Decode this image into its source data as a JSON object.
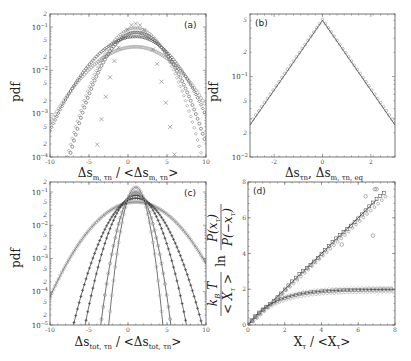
{
  "chart_data": [
    {
      "panel": "(a)",
      "type": "scatter",
      "title": "",
      "xlabel": "Δs_{m,τn} / <Δs_{m,τn}>",
      "ylabel": "pdf",
      "xlim": [
        -10,
        10
      ],
      "ylim": [
        0.0001,
        0.2
      ],
      "yscale": "log",
      "xticks": [
        -10,
        -5,
        0,
        5,
        10
      ],
      "yticks_major": [
        "10^-4",
        "10^-3",
        "10^-2",
        "10^-1"
      ],
      "yticks_minor_labels": [
        "2",
        "5"
      ],
      "grid": false,
      "legend": null,
      "series": [
        {
          "name": "series-1 (widest, light circles)",
          "marker": "circle",
          "color": "#999999",
          "peak_x": 1.0,
          "peak_y": 0.035,
          "left_end": [
            -10,
            0.0006
          ],
          "right_end": [
            10,
            0.0015
          ]
        },
        {
          "name": "series-2 (dark diamonds)",
          "marker": "diamond",
          "color": "#444444",
          "peak_x": 1.0,
          "peak_y": 0.06,
          "left_end": [
            -10,
            0.0004
          ],
          "right_end": [
            10,
            0.0009
          ]
        },
        {
          "name": "series-3 (dark circles)",
          "marker": "circle",
          "color": "#555555",
          "peak_x": 1.0,
          "peak_y": 0.075,
          "left_end": [
            -7.5,
            0.0001
          ],
          "right_end": [
            10,
            0.0002
          ]
        },
        {
          "name": "series-4 (light diamonds)",
          "marker": "diamond",
          "color": "#888888",
          "peak_x": 1.0,
          "peak_y": 0.095,
          "left_end": [
            -7.8,
            0.0001
          ],
          "right_end": [
            9.5,
            0.0001
          ]
        },
        {
          "name": "series-5 (crosses, narrowest)",
          "marker": "x",
          "color": "#777777",
          "peak_x": 1.0,
          "peak_y": 0.12,
          "left_end": [
            -4.2,
            0.0001
          ],
          "right_end": [
            6.0,
            0.0001
          ]
        }
      ],
      "annotation": "(a)"
    },
    {
      "panel": "(b)",
      "type": "scatter",
      "title": "",
      "xlabel": "Δs_{τn},  Δs_{m,τn,eq}",
      "ylabel": "pdf",
      "xlim": [
        -3,
        3
      ],
      "ylim": [
        0.01,
        0.6
      ],
      "yscale": "log",
      "xticks": [
        -2,
        0,
        2
      ],
      "yticks_major": [
        "10^-2",
        "10^-1"
      ],
      "yticks_minor_labels": [
        "2",
        "5",
        "2",
        "5"
      ],
      "grid": false,
      "legend": null,
      "series": [
        {
          "name": "data (circles)",
          "marker": "circle",
          "color": "#999999",
          "x": [
            -3,
            -2,
            -1,
            0,
            1,
            2,
            3
          ],
          "y": [
            0.025,
            0.06,
            0.16,
            0.52,
            0.19,
            0.07,
            0.025
          ]
        },
        {
          "name": "fit (line)",
          "marker": "line",
          "color": "#333333",
          "x": [
            -3,
            0,
            3
          ],
          "y": [
            0.025,
            0.5,
            0.025
          ]
        }
      ],
      "annotation": "(b)"
    },
    {
      "panel": "(c)",
      "type": "scatter",
      "title": "",
      "xlabel": "Δs_{tot,τn} / <Δs_{tot,τn}>",
      "ylabel": "pdf",
      "xlim": [
        -10,
        10
      ],
      "ylim": [
        1e-05,
        0.2
      ],
      "yscale": "log",
      "xticks": [
        -10,
        -5,
        0,
        5,
        10
      ],
      "yticks_major": [
        "10^-5",
        "10^-4",
        "10^-3",
        "10^-2",
        "10^-1"
      ],
      "yticks_minor_labels": [
        "2",
        "5"
      ],
      "grid": false,
      "legend": null,
      "series": [
        {
          "name": "series-1 (widest, light circles)",
          "marker": "circle",
          "color": "#999999",
          "peak_x": 1.0,
          "peak_y": 0.05,
          "left_end": [
            -10,
            7e-05
          ],
          "right_end": [
            10,
            0.0007
          ]
        },
        {
          "name": "series-2 (dark stars)",
          "marker": "star",
          "color": "#444444",
          "peak_x": 1.0,
          "peak_y": 0.065,
          "left_end": [
            -7.0,
            1e-05
          ],
          "right_end": [
            9.5,
            1e-05
          ]
        },
        {
          "name": "series-3 (dark stars)",
          "marker": "star",
          "color": "#444444",
          "peak_x": 1.0,
          "peak_y": 0.08,
          "left_end": [
            -5.5,
            1e-05
          ],
          "right_end": [
            7.5,
            1e-05
          ]
        },
        {
          "name": "series-4 (light)",
          "marker": "circle",
          "color": "#888888",
          "peak_x": 1.0,
          "peak_y": 0.1,
          "left_end": [
            -3.5,
            1e-05
          ],
          "right_end": [
            5.5,
            1e-05
          ]
        },
        {
          "name": "series-5 (narrowest)",
          "marker": "circle",
          "color": "#aaaaaa",
          "peak_x": 1.0,
          "peak_y": 0.14,
          "left_end": [
            -1.5,
            0.001
          ],
          "right_end": [
            3.5,
            0.001
          ]
        }
      ],
      "annotation": "(c)"
    },
    {
      "panel": "(d)",
      "type": "scatter",
      "title": "",
      "xlabel": "X_τ / <X_τ>",
      "ylabel": "k_B T / <X_τ> ln P(x_τ)/P(-x_τ)",
      "xlim": [
        0,
        8
      ],
      "ylim": [
        0,
        8
      ],
      "yscale": "linear",
      "xticks": [
        0,
        2,
        4,
        6,
        8
      ],
      "yticks": [
        0,
        2,
        4,
        6,
        8
      ],
      "grid": false,
      "legend": null,
      "series": [
        {
          "name": "linear branch data (squares/circles/crosses)",
          "marker": "square",
          "color": "#555555",
          "x": [
            0,
            1,
            2,
            3,
            4,
            5,
            6,
            7
          ],
          "y": [
            0,
            1,
            2,
            3,
            4,
            5,
            6,
            7
          ]
        },
        {
          "name": "linear fit",
          "marker": "line",
          "color": "#333333",
          "x": [
            0,
            7
          ],
          "y": [
            0,
            7
          ]
        },
        {
          "name": "saturating branch data",
          "marker": "circle",
          "color": "#888888",
          "x": [
            0,
            1,
            2,
            3,
            4,
            5,
            6,
            7,
            8
          ],
          "y": [
            0,
            0.9,
            1.4,
            1.7,
            1.85,
            1.95,
            2.0,
            2.0,
            2.0
          ]
        },
        {
          "name": "saturating fit",
          "marker": "line",
          "color": "#333333",
          "x": [
            0,
            2,
            4,
            6,
            8
          ],
          "y": [
            0,
            1.35,
            1.8,
            1.95,
            2.0
          ]
        },
        {
          "name": "outliers",
          "marker": "circle",
          "color": "#777777",
          "x": [
            5.1,
            6.8,
            6.4,
            6.9,
            7.0
          ],
          "y": [
            4.5,
            5.0,
            7.2,
            7.6,
            7.6
          ]
        }
      ],
      "annotation": "(d)"
    }
  ],
  "labels": {
    "a": {
      "panel": "(a)",
      "ylabel": "pdf",
      "xlabel_main": "Δs",
      "xlabel_sub": "m, τn",
      "xlabel_sep": " / <Δs",
      "xlabel_sub2": "m, τn",
      "xlabel_end": ">",
      "xticks": [
        "-10",
        "-5",
        "0",
        "5",
        "10"
      ]
    },
    "b": {
      "panel": "(b)",
      "ylabel": "pdf",
      "xlabel_a": "Δs",
      "xlabel_a_sub": "τn",
      "xlabel_comma": ",  Δs",
      "xlabel_b_sub": "m, τn, eq",
      "xticks": [
        "-2",
        "0",
        "2"
      ]
    },
    "c": {
      "panel": "(c)",
      "ylabel": "pdf",
      "xlabel_main": "Δs",
      "xlabel_sub": "tot, τn",
      "xlabel_sep": " / <Δs",
      "xlabel_sub2": "tot, τn",
      "xlabel_end": ">",
      "xticks": [
        "-10",
        "-5",
        "0",
        "5",
        "10"
      ]
    },
    "d": {
      "panel": "(d)",
      "ylabel_frac_num": "k",
      "ylabel_kB_sub": "B",
      "ylabel_T": " T",
      "ylabel_den": "< X",
      "ylabel_den_sub": "τ",
      "ylabel_den_end": " >",
      "ylabel_ln": "ln",
      "ylabel_ratio_num": "P(x",
      "ylabel_ratio_num_sub": "τ",
      "ylabel_ratio_num_end": ")",
      "ylabel_ratio_den": "P(−x",
      "ylabel_ratio_den_sub": "τ",
      "ylabel_ratio_den_end": ")",
      "xlabel": "X",
      "xlabel_sub": "τ",
      "xlabel_sep": " / <X",
      "xlabel_sub2": "τ",
      "xlabel_end": ">",
      "xticks": [
        "0",
        "2",
        "4",
        "6",
        "8"
      ],
      "yticks": [
        "0",
        "2",
        "4",
        "6",
        "8"
      ]
    }
  }
}
